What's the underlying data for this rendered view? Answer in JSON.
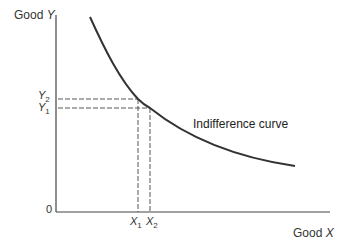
{
  "diagram": {
    "type": "indifference-curve",
    "y_axis_label": {
      "prefix": "Good ",
      "var": "Y"
    },
    "x_axis_label": {
      "prefix": "Good ",
      "var": "X"
    },
    "origin_label": "0",
    "curve_label": "Indifference curve",
    "y_ticks": [
      {
        "var": "Y",
        "sub": "2"
      },
      {
        "var": "Y",
        "sub": "1"
      }
    ],
    "x_ticks": [
      {
        "var": "X",
        "sub": "1"
      },
      {
        "var": "X",
        "sub": "2"
      }
    ],
    "colors": {
      "line": "#333333",
      "dash": "#444444",
      "text": "#333333"
    }
  }
}
